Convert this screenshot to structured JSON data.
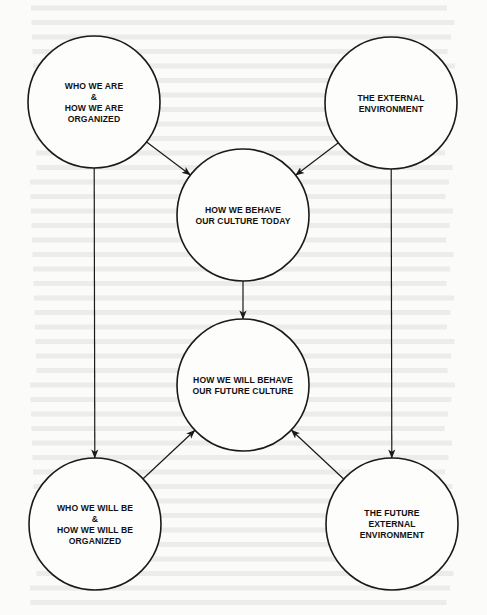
{
  "diagram": {
    "title": "",
    "nodes": [
      {
        "id": "who-we-are",
        "lines": [
          "WHO WE ARE",
          "&",
          "HOW WE ARE",
          "ORGANIZED"
        ]
      },
      {
        "id": "external-environment",
        "lines": [
          "THE EXTERNAL",
          "ENVIRONMENT"
        ]
      },
      {
        "id": "culture-today",
        "lines": [
          "HOW WE BEHAVE",
          "OUR CULTURE TODAY"
        ]
      },
      {
        "id": "future-culture",
        "lines": [
          "HOW WE WILL BEHAVE",
          "OUR FUTURE CULTURE"
        ]
      },
      {
        "id": "who-we-will-be",
        "lines": [
          "WHO WE WILL BE",
          "&",
          "HOW WE WILL BE",
          "ORGANIZED"
        ]
      },
      {
        "id": "future-external-environment",
        "lines": [
          "THE FUTURE",
          "EXTERNAL",
          "ENVIRONMENT"
        ]
      }
    ],
    "edges": [
      {
        "from": "who-we-are",
        "to": "culture-today"
      },
      {
        "from": "external-environment",
        "to": "culture-today"
      },
      {
        "from": "culture-today",
        "to": "future-culture"
      },
      {
        "from": "who-we-are",
        "to": "who-we-will-be"
      },
      {
        "from": "external-environment",
        "to": "future-external-environment"
      },
      {
        "from": "who-we-will-be",
        "to": "future-culture"
      },
      {
        "from": "future-external-environment",
        "to": "future-culture"
      }
    ],
    "colors": {
      "stroke": "#1a1a1a",
      "text": "#111111",
      "background": "#fbfbfa"
    }
  }
}
